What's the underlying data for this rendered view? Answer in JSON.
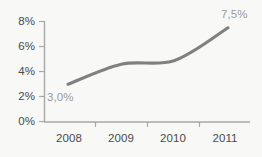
{
  "chart_data": {
    "type": "line",
    "title": "",
    "subtitle": "",
    "xlabel": "",
    "ylabel": "",
    "categories": [
      "2008",
      "2009",
      "2010",
      "2011"
    ],
    "values": [
      3.0,
      4.6,
      4.9,
      7.5
    ],
    "series": [
      {
        "name": "",
        "values": [
          3.0,
          4.6,
          4.9,
          7.5
        ]
      }
    ],
    "ylim": [
      0,
      8
    ],
    "y_ticks": [
      0,
      2,
      4,
      6,
      8
    ],
    "y_tick_labels": [
      "0%",
      "2%",
      "4%",
      "6%",
      "8%"
    ],
    "x_tick_labels": [
      "2008",
      "2009",
      "2010",
      "2011"
    ],
    "grid": false,
    "legend": false,
    "legend_position": "none",
    "smoothing": "spline",
    "annotations": [
      {
        "text": "3,0%",
        "series_index": 0,
        "point_index": 0,
        "value": 3.0,
        "position": "below-right"
      },
      {
        "text": "7,5%",
        "series_index": 0,
        "point_index": 3,
        "value": 7.5,
        "position": "above-right"
      }
    ],
    "colors": {
      "line": "#808080",
      "axis": "#a8a8a6",
      "tick_text": "#4a4a4a",
      "annotation_text": "#9b9b99",
      "background": "#f8f8f7"
    }
  },
  "axes": {
    "y_labels": [
      "8%",
      "6%",
      "4%",
      "2%",
      "0%"
    ],
    "x_labels": [
      "2008",
      "2009",
      "2010",
      "2011"
    ]
  },
  "annotations": {
    "start_label": "3,0%",
    "end_label": "7,5%"
  }
}
